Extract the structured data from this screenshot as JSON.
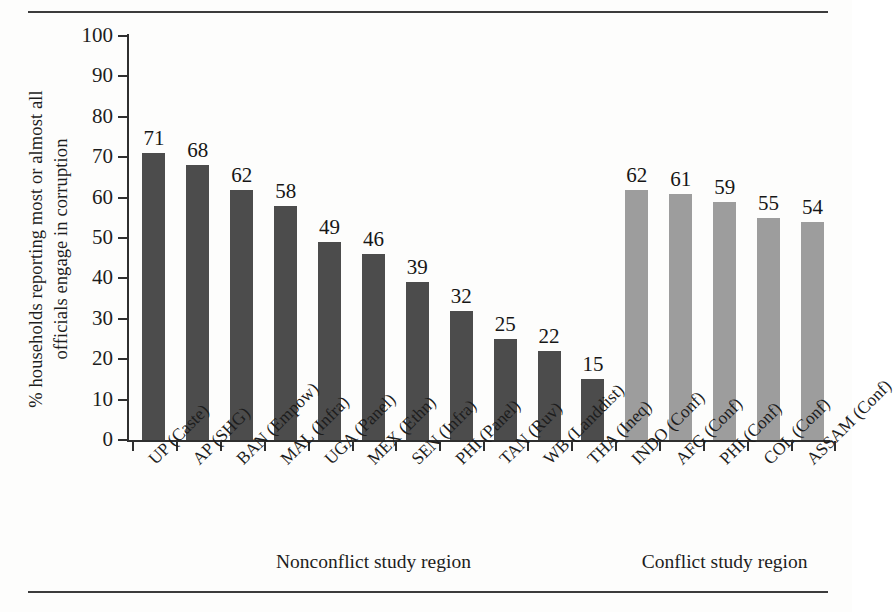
{
  "chart_data": {
    "type": "bar",
    "title": "",
    "xlabel": "",
    "ylabel": "% households reporting most or almost all officials engage in corruption",
    "ylabel_line1": "% households reporting most or almost all",
    "ylabel_line2": "officials engage in corruption",
    "ylim": [
      0,
      100
    ],
    "yticks": [
      0,
      10,
      20,
      30,
      40,
      50,
      60,
      70,
      80,
      90,
      100
    ],
    "grid": false,
    "legend": "none",
    "categories": [
      "UP (Caste)",
      "AP (SHG)",
      "BAN (Empow)",
      "MAL (Infra)",
      "UGA (Panel)",
      "MEX (Ethn)",
      "SEN (Infra)",
      "PHI (Panel)",
      "TAN (Ruv)",
      "WB (Landdist)",
      "THA (Ineq)",
      "INDO (Conf)",
      "AFG (Conf)",
      "PHI (Conf)",
      "COL (Conf)",
      "ASSAM (Conf)"
    ],
    "values": [
      71,
      68,
      62,
      58,
      49,
      46,
      39,
      32,
      25,
      22,
      15,
      62,
      61,
      59,
      55,
      54
    ],
    "groups": [
      "nonconflict",
      "nonconflict",
      "nonconflict",
      "nonconflict",
      "nonconflict",
      "nonconflict",
      "nonconflict",
      "nonconflict",
      "nonconflict",
      "nonconflict",
      "nonconflict",
      "conflict",
      "conflict",
      "conflict",
      "conflict",
      "conflict"
    ],
    "group_labels": [
      {
        "key": "nonconflict",
        "label": "Nonconflict study region"
      },
      {
        "key": "conflict",
        "label": "Conflict study region"
      }
    ],
    "colors": {
      "nonconflict": "#4c4c4c",
      "conflict": "#9d9d9d",
      "axis": "#2f2f2f",
      "text": "#1d1d1d",
      "background": "#fdfdfc"
    }
  }
}
